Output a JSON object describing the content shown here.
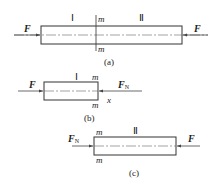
{
  "figure": {
    "panel_a": {
      "caption": "(a)",
      "force_left": "F",
      "force_right": "F",
      "segment_left": "Ⅰ",
      "segment_right": "Ⅱ",
      "section_top": "m",
      "section_bottom": "m"
    },
    "panel_b": {
      "caption": "(b)",
      "force_left": "F",
      "internal_force": "F",
      "internal_force_sub": "N",
      "segment": "Ⅰ",
      "section_top": "m",
      "section_bottom": "m",
      "axis": "x"
    },
    "panel_c": {
      "caption": "(c)",
      "internal_force": "F",
      "internal_force_sub": "N",
      "force_right": "F",
      "segment": "Ⅱ",
      "section_top": "m",
      "section_bottom": "m"
    },
    "colors": {
      "line": "#333333",
      "background": "#ffffff"
    }
  }
}
